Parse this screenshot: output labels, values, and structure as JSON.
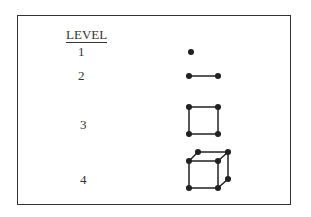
{
  "header": {
    "label": "LEVEL"
  },
  "levels": [
    {
      "number": "1",
      "shape": "point"
    },
    {
      "number": "2",
      "shape": "line-segment"
    },
    {
      "number": "3",
      "shape": "square"
    },
    {
      "number": "4",
      "shape": "cube"
    }
  ]
}
